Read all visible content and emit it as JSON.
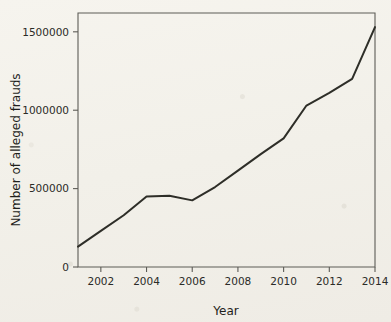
{
  "chart_data": {
    "type": "line",
    "title": "",
    "xlabel": "Year",
    "ylabel": "Number of alleged frauds",
    "x": [
      2001,
      2002,
      2003,
      2004,
      2005,
      2006,
      2007,
      2008,
      2009,
      2010,
      2011,
      2012,
      2013,
      2014
    ],
    "values": [
      130000,
      230000,
      330000,
      450000,
      455000,
      425000,
      510000,
      615000,
      720000,
      820000,
      1030000,
      1110000,
      1200000,
      1530000
    ],
    "series": [
      {
        "name": "Number of alleged frauds",
        "values": [
          130000,
          230000,
          330000,
          450000,
          455000,
          425000,
          510000,
          615000,
          720000,
          820000,
          1030000,
          1110000,
          1200000,
          1530000
        ]
      }
    ],
    "xlim": [
      2001,
      2014
    ],
    "ylim": [
      0,
      1620000
    ],
    "xticks": [
      2002,
      2004,
      2006,
      2008,
      2010,
      2012,
      2014
    ],
    "xtick_labels": [
      "2002",
      "2004",
      "2006",
      "2008",
      "2010",
      "2012",
      "2014"
    ],
    "yticks": [
      0,
      500000,
      1000000,
      1500000
    ],
    "ytick_labels": [
      "0",
      "500000",
      "1000000",
      "1500000"
    ],
    "grid": false,
    "legend": false,
    "line_color": "#2e2e28",
    "axis_color": "#5d5c57",
    "background_color": "#f2f0e9"
  }
}
